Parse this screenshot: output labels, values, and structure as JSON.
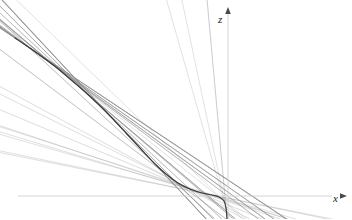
{
  "figure": {
    "type": "envelope-of-tangent-lines",
    "title": "",
    "background_color": "#ffffff",
    "width": 352,
    "height": 219
  },
  "axes": {
    "x_axis": {
      "label": "x",
      "label_icon": "x-axis-arrow-icon",
      "orientation": "horizontal",
      "y_pixel": 196,
      "x_start": 18,
      "x_end": 332,
      "color": "#cfcfcf",
      "arrowhead": true
    },
    "z_axis": {
      "label": "z",
      "label_icon": "z-axis-arrow-icon",
      "orientation": "vertical",
      "x_pixel": 228,
      "y_start": 12,
      "y_end": 214,
      "color": "#cfcfcf",
      "arrowhead": true
    }
  },
  "chart_data": {
    "type": "line",
    "title": "",
    "xlabel": "x",
    "ylabel": "z",
    "grid": false,
    "legend": null,
    "envelope_curve": {
      "name": "envelope",
      "color": "#3a3a3a",
      "points": [
        [
          15,
          38
        ],
        [
          24,
          44
        ],
        [
          34,
          51
        ],
        [
          45,
          59
        ],
        [
          57,
          68
        ],
        [
          70,
          79
        ],
        [
          84,
          91
        ],
        [
          98,
          104
        ],
        [
          112,
          118
        ],
        [
          126,
          133
        ],
        [
          140,
          148
        ],
        [
          153,
          162
        ],
        [
          166,
          174
        ],
        [
          178,
          183
        ],
        [
          190,
          189
        ],
        [
          202,
          193
        ],
        [
          212,
          195
        ],
        [
          219,
          197
        ],
        [
          224,
          201
        ],
        [
          226,
          208
        ],
        [
          227,
          219
        ]
      ]
    },
    "tangent_family": {
      "count": 46,
      "color": "#8a8a8a",
      "parameter_range": [
        0,
        1
      ],
      "description": "Straight tangent lines drawn across the full frame; densest near the envelope, sparsest at the far left and lower right."
    },
    "xlim": [
      0,
      352
    ],
    "ylim": [
      219,
      0
    ]
  },
  "colors": {
    "envelope": "#3a3a3a",
    "tangent": "#8a8a8a",
    "axis": "#cfcfcf",
    "label": "#1a1a1a",
    "background": "#ffffff"
  }
}
